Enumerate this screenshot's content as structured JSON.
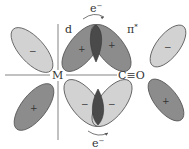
{
  "diagram": {
    "type": "orbital-overlap",
    "labels": {
      "metal": "M",
      "ligand": "C≡O",
      "d_orbital": "d",
      "pi_star": "π",
      "pi_star_sup": "*",
      "electron": "e",
      "electron_sup": "−"
    },
    "lobes": [
      {
        "id": "left-upper",
        "sign": "−",
        "shade": "light"
      },
      {
        "id": "d-upper",
        "sign": "+",
        "shade": "dark"
      },
      {
        "id": "pistar-upper",
        "sign": "+",
        "shade": "dark"
      },
      {
        "id": "right-upper",
        "sign": "−",
        "shade": "light"
      },
      {
        "id": "left-lower",
        "sign": "+",
        "shade": "dark"
      },
      {
        "id": "d-lower",
        "sign": "−",
        "shade": "light"
      },
      {
        "id": "pistar-lower",
        "sign": "−",
        "shade": "light"
      },
      {
        "id": "right-lower",
        "sign": "+",
        "shade": "dark"
      }
    ],
    "colors": {
      "light": "#d2d2d2",
      "dark": "#8c8c8c",
      "overlap": "#4a4a4a",
      "stroke": "#555555",
      "line": "#777777"
    }
  }
}
